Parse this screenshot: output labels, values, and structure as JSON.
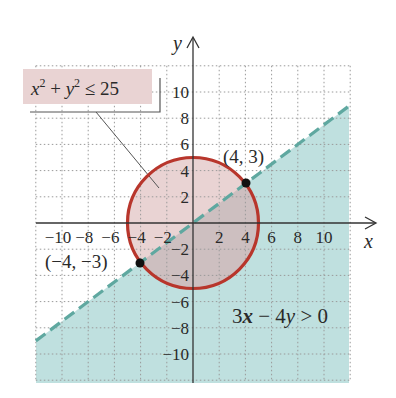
{
  "chart_data": {
    "type": "region",
    "title": "",
    "xlabel": "x",
    "ylabel": "y",
    "xlim": [
      -12,
      12
    ],
    "ylim": [
      -12,
      12
    ],
    "grid": true,
    "grid_step": 2,
    "x_ticks": [
      -10,
      -8,
      -6,
      -4,
      -2,
      2,
      4,
      6,
      8,
      10
    ],
    "y_ticks": [
      -10,
      -8,
      -6,
      -4,
      -2,
      2,
      4,
      6,
      8,
      10
    ],
    "x_tick_labels": [
      "−10",
      "−8",
      "−6",
      "−4",
      "−2",
      "2",
      "4",
      "6",
      "8",
      "10"
    ],
    "y_tick_labels": [
      "−10",
      "−8",
      "−6",
      "−4",
      "−2",
      "2",
      "4",
      "6",
      "8",
      "10"
    ],
    "regions": [
      {
        "name": "disk",
        "inequality": "x² + y² ≤ 25",
        "boundary": "circle",
        "center": [
          0,
          0
        ],
        "radius": 5,
        "boundary_style": "solid",
        "fill": "#e9d3d3",
        "stroke": "#b8362c"
      },
      {
        "name": "half-plane",
        "inequality": "3x − 4y > 0",
        "boundary": "line",
        "line": "y = 0.75x",
        "boundary_style": "dashed",
        "shaded_side": "below",
        "fill": "#bfe0df",
        "stroke": "#5fa8a0"
      }
    ],
    "overlap_fill": "#cdbfc0",
    "points": [
      {
        "x": 4,
        "y": 3,
        "label": "(4, 3)"
      },
      {
        "x": -4,
        "y": -3,
        "label": "(−4, −3)"
      }
    ],
    "annotations": [
      {
        "text": "x² + y² ≤ 25",
        "target": "disk",
        "boxed": true,
        "box_fill": "#e9d3d3"
      },
      {
        "text": "3x − 4y > 0",
        "target": "half-plane",
        "boxed": false
      }
    ]
  },
  "labels": {
    "x_axis": "x",
    "y_axis": "y",
    "circle_inequality_x": "x",
    "circle_inequality_sup1": "2",
    "circle_inequality_plus": " + ",
    "circle_inequality_y": "y",
    "circle_inequality_sup2": "2",
    "circle_inequality_rest": " ≤ 25",
    "line_inequality_coef": "3",
    "line_inequality_x": "x",
    "line_inequality_mid": " − 4",
    "line_inequality_y": "y",
    "line_inequality_rest": " > 0",
    "point_a": "(4, 3)",
    "point_b": "(−4, −3)"
  }
}
